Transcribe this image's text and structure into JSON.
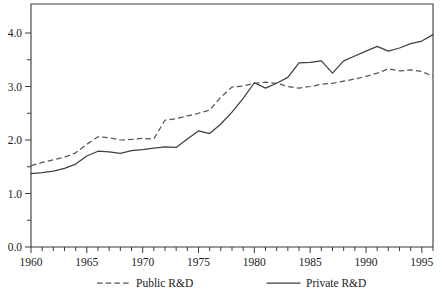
{
  "chart_data": {
    "type": "line",
    "title": "",
    "xlabel": "",
    "ylabel": "",
    "xlim": [
      1960,
      1996
    ],
    "ylim": [
      0.0,
      4.5
    ],
    "grid": false,
    "legend_position": "bottom",
    "y_ticks_major": [
      "0.0",
      "1.0",
      "2.0",
      "3.0",
      "4.0"
    ],
    "y_tick_values_major": [
      0.0,
      1.0,
      2.0,
      3.0,
      4.0
    ],
    "y_tick_values_minor": [
      0.5,
      1.5,
      2.5,
      3.5
    ],
    "x_ticks_labeled": [
      "1960",
      "1965",
      "1970",
      "1975",
      "1980",
      "1985",
      "1990",
      "1995"
    ],
    "x_tick_values_labeled": [
      1960,
      1965,
      1970,
      1975,
      1980,
      1985,
      1990,
      1995
    ],
    "x": [
      1960,
      1961,
      1962,
      1963,
      1964,
      1965,
      1966,
      1967,
      1968,
      1969,
      1970,
      1971,
      1972,
      1973,
      1974,
      1975,
      1976,
      1977,
      1978,
      1979,
      1980,
      1981,
      1982,
      1983,
      1984,
      1985,
      1986,
      1987,
      1988,
      1989,
      1990,
      1991,
      1992,
      1993,
      1994,
      1995,
      1996
    ],
    "series": [
      {
        "name": "Public R&D",
        "style": "dashed",
        "color": "#55555c",
        "values": [
          1.52,
          1.58,
          1.63,
          1.68,
          1.76,
          1.92,
          2.06,
          2.04,
          2.0,
          2.01,
          2.03,
          2.02,
          2.37,
          2.4,
          2.45,
          2.5,
          2.56,
          2.8,
          2.99,
          3.01,
          3.06,
          3.08,
          3.06,
          3.0,
          2.97,
          3.0,
          3.04,
          3.06,
          3.1,
          3.14,
          3.19,
          3.25,
          3.33,
          3.29,
          3.31,
          3.28,
          3.19
        ]
      },
      {
        "name": "Private R&D",
        "style": "solid",
        "color": "#3f3f46",
        "values": [
          1.37,
          1.39,
          1.42,
          1.47,
          1.55,
          1.7,
          1.79,
          1.78,
          1.75,
          1.8,
          1.82,
          1.85,
          1.87,
          1.86,
          2.02,
          2.17,
          2.12,
          2.3,
          2.52,
          2.78,
          3.07,
          2.97,
          3.06,
          3.17,
          3.44,
          3.45,
          3.48,
          3.25,
          3.48,
          3.57,
          3.66,
          3.75,
          3.66,
          3.72,
          3.8,
          3.85,
          3.97
        ]
      }
    ],
    "legend": [
      {
        "label": "Public R&D",
        "style": "dashed"
      },
      {
        "label": "Private R&D",
        "style": "solid"
      }
    ]
  }
}
